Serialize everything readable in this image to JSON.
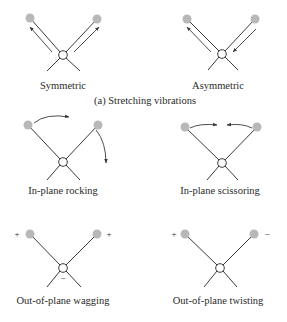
{
  "figure": {
    "section_caption": "(a) Stretching vibrations",
    "colors": {
      "atom": "#b8b8b8",
      "line": "#3a3a3a",
      "center_fill": "#ffffff",
      "text": "#2a2a2a"
    },
    "modes": [
      {
        "id": "symmetric",
        "label": "Symmetric",
        "group": "stretching"
      },
      {
        "id": "asymmetric",
        "label": "Asymmetric",
        "group": "stretching"
      },
      {
        "id": "rocking",
        "label": "In-plane rocking",
        "group": "bending"
      },
      {
        "id": "scissoring",
        "label": "In-plane scissoring",
        "group": "bending"
      },
      {
        "id": "wagging",
        "label": "Out-of-plane wagging",
        "group": "bending",
        "signs": {
          "left": "+",
          "right": "+",
          "center": "−"
        }
      },
      {
        "id": "twisting",
        "label": "Out-of-plane twisting",
        "group": "bending",
        "signs": {
          "left": "+",
          "right": "−"
        }
      }
    ]
  }
}
